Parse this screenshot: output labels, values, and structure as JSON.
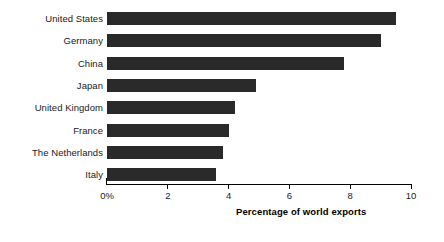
{
  "chart_data": {
    "type": "bar",
    "orientation": "horizontal",
    "title": "",
    "xlabel": "Percentage of world exports",
    "ylabel": "",
    "categories": [
      "United States",
      "Germany",
      "China",
      "Japan",
      "United Kingdom",
      "France",
      "The Netherlands",
      "Italy"
    ],
    "values": [
      9.5,
      9.0,
      7.8,
      4.9,
      4.2,
      4.0,
      3.8,
      3.6
    ],
    "xlim": [
      0,
      10
    ],
    "xticks": [
      0,
      2,
      4,
      6,
      8,
      10
    ],
    "xtick_labels": [
      "0%",
      "2",
      "4",
      "6",
      "8",
      "10"
    ],
    "grid": false,
    "legend": null,
    "bar_color": "#2a2a2a",
    "axis_color": "#000000",
    "background_color": "#ffffff"
  }
}
